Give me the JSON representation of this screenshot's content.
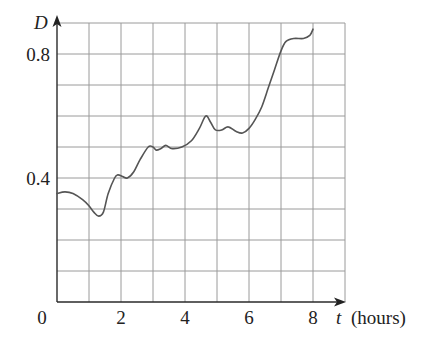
{
  "chart_data": {
    "type": "line",
    "title": "",
    "xlabel": "t (hours)",
    "ylabel": "D",
    "xlim": [
      0,
      9
    ],
    "ylim": [
      0,
      0.9
    ],
    "grid": true,
    "x_ticks": [
      {
        "value": 0,
        "label": "0"
      },
      {
        "value": 2,
        "label": "2"
      },
      {
        "value": 4,
        "label": "4"
      },
      {
        "value": 6,
        "label": "6"
      },
      {
        "value": 8,
        "label": "8"
      }
    ],
    "y_ticks": [
      {
        "value": 0.4,
        "label": "0.4"
      },
      {
        "value": 0.8,
        "label": "0.8"
      }
    ],
    "grid_x_step": 1,
    "grid_y_step": 0.1,
    "series": [
      {
        "name": "D",
        "color": "#555555",
        "x": [
          0,
          0.25,
          0.5,
          0.8,
          1.0,
          1.15,
          1.3,
          1.45,
          1.6,
          1.8,
          1.9,
          2.05,
          2.2,
          2.4,
          2.6,
          2.85,
          3.0,
          3.1,
          3.25,
          3.4,
          3.6,
          3.9,
          4.2,
          4.45,
          4.65,
          4.8,
          4.95,
          5.15,
          5.35,
          5.6,
          5.8,
          6.0,
          6.2,
          6.4,
          6.6,
          6.8,
          7.0,
          7.15,
          7.4,
          7.7,
          7.9,
          8.0
        ],
        "values": [
          0.35,
          0.355,
          0.35,
          0.33,
          0.31,
          0.29,
          0.277,
          0.29,
          0.35,
          0.4,
          0.41,
          0.405,
          0.4,
          0.42,
          0.46,
          0.5,
          0.5,
          0.49,
          0.495,
          0.505,
          0.495,
          0.5,
          0.52,
          0.56,
          0.6,
          0.58,
          0.555,
          0.555,
          0.565,
          0.55,
          0.545,
          0.56,
          0.59,
          0.63,
          0.69,
          0.75,
          0.81,
          0.84,
          0.85,
          0.85,
          0.86,
          0.88
        ]
      }
    ]
  },
  "labels": {
    "y_axis": "D",
    "x_axis_var": "t",
    "x_axis_unit": "(hours)",
    "origin": "0"
  }
}
